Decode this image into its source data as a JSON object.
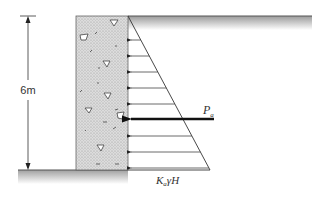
{
  "diagram": {
    "height_label": "6m",
    "resultant_label": {
      "main": "P",
      "subscript": "a"
    },
    "base_pressure_label": {
      "k": "K",
      "k_sub": "a",
      "rest": "γH"
    },
    "colors": {
      "line": "#333333",
      "wall_fill": "#d4d4d4",
      "ground_shade": "#a8a8a8",
      "background": "#ffffff"
    },
    "geometry": {
      "wall": {
        "x": 76,
        "y": 16,
        "width": 52,
        "height": 154
      },
      "triangle": {
        "apex_x": 128,
        "apex_y": 16,
        "base_x": 210,
        "base_y": 170
      },
      "backfill_surface": {
        "x1": 128,
        "x2": 312,
        "y": 16
      },
      "front_ground": {
        "x1": 18,
        "x2": 128,
        "y": 170
      },
      "dimension_line_x": 28,
      "pressure_arrows_y": [
        40,
        56,
        72,
        88,
        104,
        136,
        152,
        168
      ],
      "resultant_arrow": {
        "y": 119,
        "x_start": 214,
        "x_end": 129
      }
    }
  }
}
